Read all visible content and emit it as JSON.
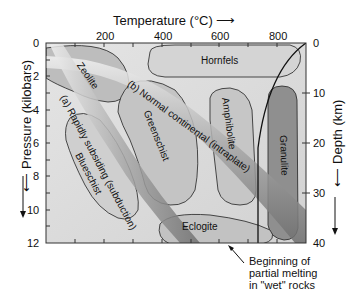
{
  "diagram": {
    "x_axis": {
      "title": "Temperature (°C) ⟶",
      "ticks": [
        "200",
        "400",
        "600",
        "800"
      ]
    },
    "y_axis_left": {
      "title": "⟵ Pressure (kilobars)",
      "ticks": [
        "0",
        "2",
        "4",
        "6",
        "8",
        "10",
        "12"
      ]
    },
    "y_axis_right": {
      "title": "⟵ Depth (km)",
      "ticks": [
        "0",
        "10",
        "20",
        "30",
        "40"
      ]
    },
    "facies": {
      "zeolite": "Zeolite",
      "hornfels": "Hornfels",
      "greenschist": "Greenschist",
      "amphibolite": "Amphibolite",
      "granulite": "Granulite",
      "blueschist": "Blueschist",
      "eclogite": "Eclogite"
    },
    "gradients": {
      "a": "(a) Rapidly subsiding (subduction)",
      "b": "(b) Normal continental (intraplate)"
    },
    "annotation": {
      "line1": "Beginning of",
      "line2": "partial melting",
      "line3": "in \"wet\" rocks"
    },
    "colors": {
      "background": "#d9d9d9",
      "facies_light": "#c8c8c8",
      "granulite": "#8f8f8f",
      "band": "#9a9a9a",
      "line": "#111111"
    }
  }
}
